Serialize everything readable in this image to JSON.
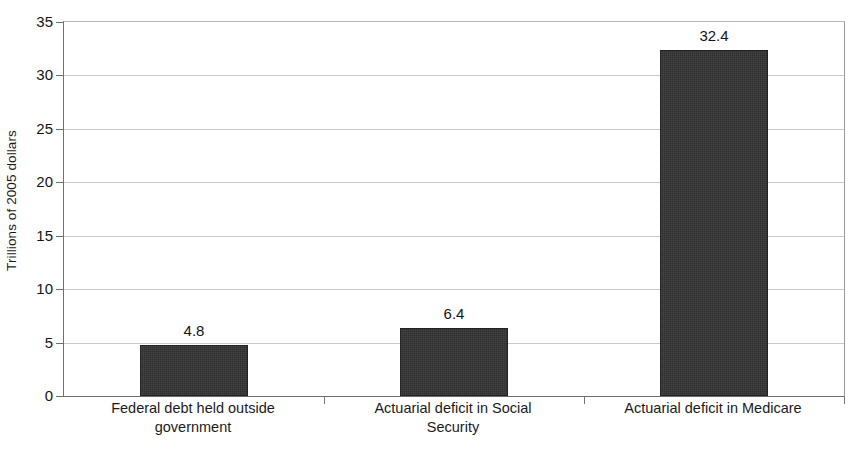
{
  "chart_data": {
    "type": "bar",
    "title": "",
    "subtitle": "",
    "xlabel": "",
    "ylabel": "Trillions of 2005 dollars",
    "ylim": [
      0,
      35
    ],
    "yticks": [
      0,
      5,
      10,
      15,
      20,
      25,
      30,
      35
    ],
    "ytick_labels": [
      "0",
      "5",
      "10",
      "15",
      "20",
      "25",
      "30",
      "35"
    ],
    "grid": true,
    "legend": false,
    "legend_position": "none",
    "categories": [
      "Federal debt held outside government",
      "Actuarial deficit in Social Security",
      "Actuarial deficit in Medicare"
    ],
    "category_label_lines": [
      [
        "Federal debt held outside",
        "government"
      ],
      [
        "Actuarial deficit in Social",
        "Security"
      ],
      [
        "Actuarial deficit in Medicare"
      ]
    ],
    "values": [
      4.8,
      6.4,
      32.4
    ],
    "value_labels": [
      "4.8",
      "6.4",
      "32.4"
    ],
    "bar_color": "#2e2e2e",
    "bar_edge_color": "#232323",
    "grid_color": "#c9c9c9",
    "axis_color": "#6f6f6f",
    "text_color": "#1b1b1b",
    "background_color": "#ffffff"
  }
}
